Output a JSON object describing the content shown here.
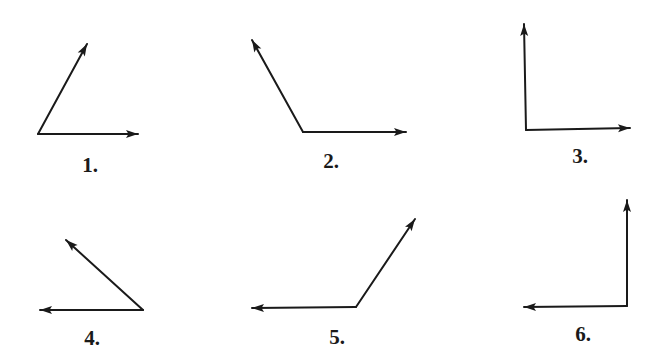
{
  "diagram": {
    "type": "angle-figures",
    "stroke_color": "#1a1a1a",
    "background": "#ffffff",
    "figures": [
      {
        "label": "1.",
        "label_pos": [
          90,
          172
        ],
        "vertex": [
          38,
          134
        ],
        "rays": [
          [
            87,
            44
          ],
          [
            138,
            134
          ]
        ],
        "kind": "acute"
      },
      {
        "label": "2.",
        "label_pos": [
          331,
          168
        ],
        "vertex": [
          303,
          132
        ],
        "rays": [
          [
            252,
            40
          ],
          [
            406,
            132
          ]
        ],
        "kind": "obtuse"
      },
      {
        "label": "3.",
        "label_pos": [
          580,
          163
        ],
        "vertex": [
          526,
          130
        ],
        "rays": [
          [
            524,
            24
          ],
          [
            630,
            128
          ]
        ],
        "kind": "right"
      },
      {
        "label": "4.",
        "label_pos": [
          92,
          345
        ],
        "vertex": [
          143,
          310
        ],
        "rays": [
          [
            66,
            240
          ],
          [
            40,
            310
          ]
        ],
        "kind": "acute"
      },
      {
        "label": "5.",
        "label_pos": [
          337,
          344
        ],
        "vertex": [
          356,
          307
        ],
        "rays": [
          [
            415,
            219
          ],
          [
            252,
            308
          ]
        ],
        "kind": "obtuse"
      },
      {
        "label": "6.",
        "label_pos": [
          583,
          341
        ],
        "vertex": [
          627,
          306
        ],
        "rays": [
          [
            627,
            200
          ],
          [
            524,
            307
          ]
        ],
        "kind": "right"
      }
    ]
  }
}
